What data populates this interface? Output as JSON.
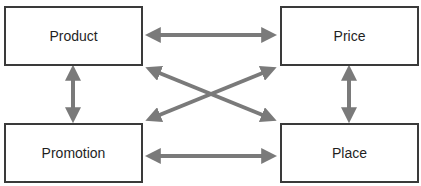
{
  "diagram": {
    "type": "4P marketing mix relationship diagram",
    "nodes": [
      {
        "id": "product",
        "label": "Product",
        "position": "top-left"
      },
      {
        "id": "price",
        "label": "Price",
        "position": "top-right"
      },
      {
        "id": "promotion",
        "label": "Promotion",
        "position": "bottom-left"
      },
      {
        "id": "place",
        "label": "Place",
        "position": "bottom-right"
      }
    ],
    "edges": [
      {
        "from": "product",
        "to": "price",
        "direction": "bidirectional"
      },
      {
        "from": "promotion",
        "to": "place",
        "direction": "bidirectional"
      },
      {
        "from": "product",
        "to": "promotion",
        "direction": "bidirectional"
      },
      {
        "from": "price",
        "to": "place",
        "direction": "bidirectional"
      },
      {
        "from": "product",
        "to": "place",
        "direction": "bidirectional"
      },
      {
        "from": "promotion",
        "to": "price",
        "direction": "bidirectional"
      }
    ],
    "colors": {
      "arrow": "#7a7a7a",
      "box_border": "#3a3a3a",
      "text": "#1f1f1f",
      "background": "#ffffff"
    }
  }
}
